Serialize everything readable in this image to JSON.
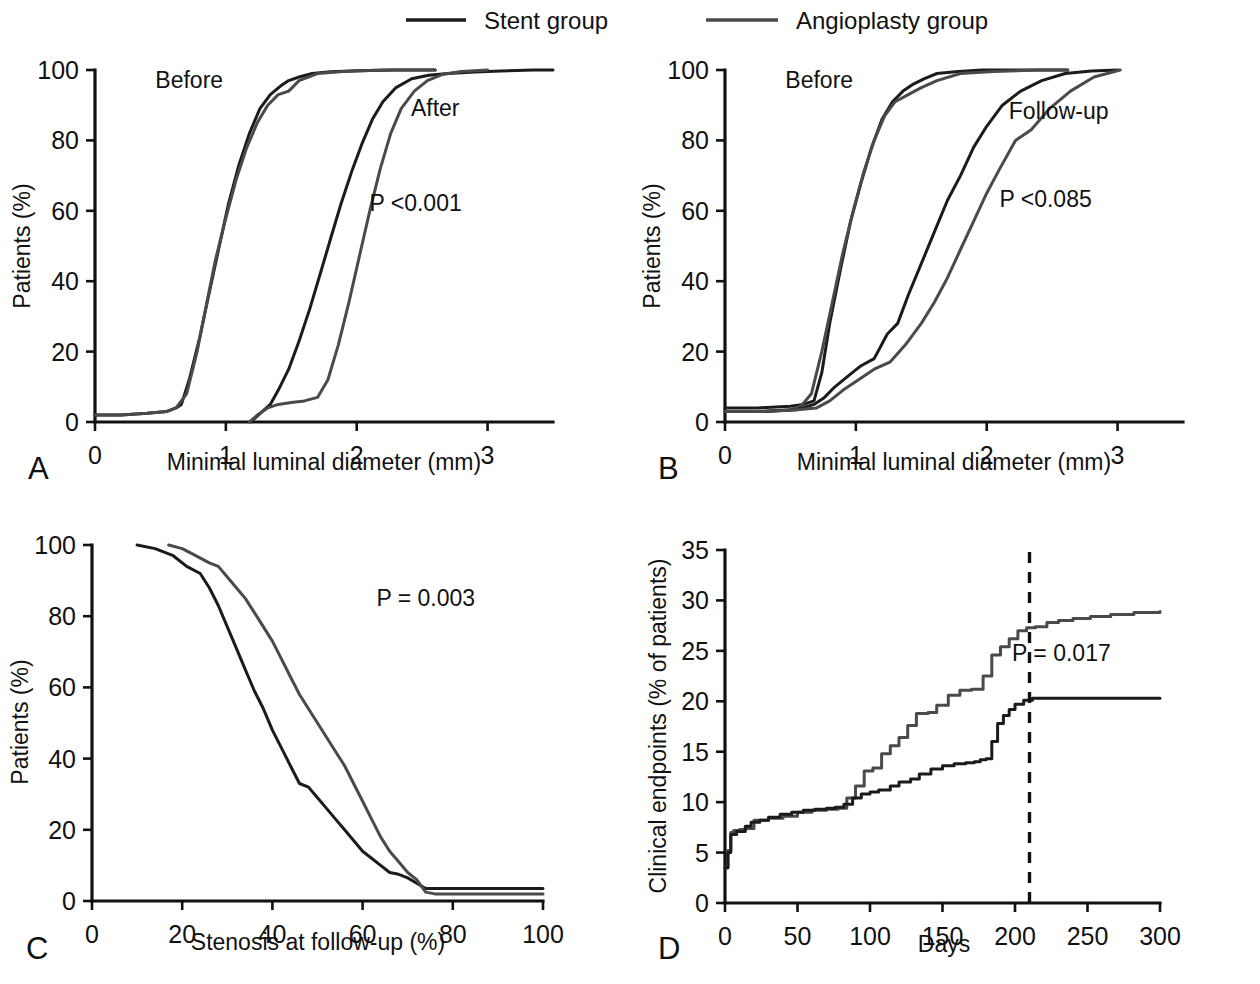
{
  "legend": {
    "items": [
      {
        "label": "Stent group",
        "color": "#1b1b1b",
        "key": "stent"
      },
      {
        "label": "Angioplasty group",
        "color": "#4a4a4a",
        "key": "angioplasty"
      }
    ]
  },
  "panels": {
    "A": {
      "letter": "A",
      "xlabel": "Minimal luminal diameter (mm)",
      "ylabel": "Patients (%)",
      "pvalue": "P <0.001",
      "group_labels": {
        "left": "Before",
        "right": "After"
      }
    },
    "B": {
      "letter": "B",
      "xlabel": "Minimal luminal diameter (mm)",
      "ylabel": "Patients (%)",
      "pvalue": "P <0.085",
      "group_labels": {
        "left": "Before",
        "right": "Follow-up"
      }
    },
    "C": {
      "letter": "C",
      "xlabel": "Stenosis at follow-up (%)",
      "ylabel": "Patients (%)",
      "pvalue": "P = 0.003"
    },
    "D": {
      "letter": "D",
      "xlabel": "Days",
      "ylabel": "Clinical endpoints (% of patients)",
      "pvalue": "P = 0.017",
      "marker_day": 210
    }
  },
  "chart_data": [
    {
      "id": "A",
      "type": "line",
      "title": "",
      "xlabel": "Minimal luminal diameter (mm)",
      "ylabel": "Patients (%)",
      "xlim": [
        0,
        3.5
      ],
      "ylim": [
        0,
        100
      ],
      "xticks": [
        0,
        1,
        2,
        3
      ],
      "yticks": [
        0,
        20,
        40,
        60,
        80,
        100
      ],
      "grid": false,
      "annotations": [
        {
          "text": "Before",
          "x": 0.72,
          "y": 95
        },
        {
          "text": "After",
          "x": 2.6,
          "y": 87
        },
        {
          "text": "P <0.001",
          "x": 2.45,
          "y": 60
        }
      ],
      "series": [
        {
          "name": "Stent group before",
          "color": "#1b1b1b",
          "x": [
            0.0,
            0.2,
            0.4,
            0.55,
            0.62,
            0.66,
            0.72,
            0.8,
            0.88,
            0.95,
            1.02,
            1.1,
            1.18,
            1.26,
            1.34,
            1.42,
            1.48,
            1.56,
            1.66,
            1.8,
            2.0,
            2.3,
            2.6
          ],
          "y": [
            2,
            2,
            2.5,
            3,
            4,
            5,
            12,
            24,
            38,
            50,
            62,
            73,
            82,
            89,
            93,
            95.5,
            97,
            98,
            99,
            99.5,
            99.8,
            100,
            100
          ]
        },
        {
          "name": "Angioplasty group before",
          "color": "#4a4a4a",
          "x": [
            0.0,
            0.2,
            0.4,
            0.55,
            0.62,
            0.7,
            0.78,
            0.85,
            0.92,
            1.0,
            1.08,
            1.16,
            1.24,
            1.32,
            1.4,
            1.48,
            1.56,
            1.7,
            1.9,
            2.2,
            2.6
          ],
          "y": [
            2,
            2,
            2.5,
            3,
            4,
            8,
            20,
            33,
            46,
            58,
            69,
            78,
            85,
            90,
            93,
            94,
            97,
            99,
            99.6,
            100,
            100
          ]
        },
        {
          "name": "Stent group after",
          "color": "#1b1b1b",
          "x": [
            1.18,
            1.22,
            1.28,
            1.34,
            1.4,
            1.48,
            1.56,
            1.64,
            1.72,
            1.8,
            1.88,
            1.96,
            2.04,
            2.12,
            2.2,
            2.3,
            2.42,
            2.55,
            2.7,
            2.9,
            3.1,
            3.35,
            3.5
          ],
          "y": [
            0,
            1,
            3,
            5,
            9,
            15,
            23,
            32,
            42,
            52,
            62,
            71,
            79,
            86,
            91,
            95,
            97.5,
            98.5,
            99,
            99.4,
            99.7,
            100,
            100
          ]
        },
        {
          "name": "Angioplasty group after",
          "color": "#4a4a4a",
          "x": [
            1.18,
            1.24,
            1.32,
            1.4,
            1.5,
            1.6,
            1.7,
            1.78,
            1.86,
            1.94,
            2.02,
            2.1,
            2.18,
            2.26,
            2.34,
            2.44,
            2.54,
            2.66,
            2.8,
            3.0
          ],
          "y": [
            0,
            2,
            4,
            5,
            5.5,
            6,
            7,
            12,
            22,
            34,
            47,
            60,
            72,
            82,
            89,
            94,
            97,
            98.8,
            99.6,
            100
          ]
        }
      ]
    },
    {
      "id": "B",
      "type": "line",
      "title": "",
      "xlabel": "Minimal luminal diameter (mm)",
      "ylabel": "Patients (%)",
      "xlim": [
        0,
        3.5
      ],
      "ylim": [
        0,
        100
      ],
      "xticks": [
        0,
        1,
        2,
        3
      ],
      "yticks": [
        0,
        20,
        40,
        60,
        80,
        100
      ],
      "grid": false,
      "annotations": [
        {
          "text": "Before",
          "x": 0.72,
          "y": 95
        },
        {
          "text": "Follow-up",
          "x": 2.55,
          "y": 86
        },
        {
          "text": "P <0.085",
          "x": 2.45,
          "y": 61
        }
      ],
      "series": [
        {
          "name": "Stent group before",
          "color": "#1b1b1b",
          "x": [
            0.0,
            0.25,
            0.5,
            0.6,
            0.68,
            0.74,
            0.8,
            0.88,
            0.96,
            1.04,
            1.12,
            1.2,
            1.28,
            1.36,
            1.44,
            1.52,
            1.62,
            1.76,
            1.96,
            2.25,
            2.62
          ],
          "y": [
            4,
            4,
            4.5,
            5,
            6,
            14,
            28,
            43,
            57,
            68,
            78,
            86,
            91,
            94,
            96,
            97.5,
            99,
            99.5,
            100,
            100,
            100
          ]
        },
        {
          "name": "Angioplasty group before",
          "color": "#4a4a4a",
          "x": [
            0.0,
            0.25,
            0.5,
            0.58,
            0.66,
            0.74,
            0.82,
            0.9,
            0.98,
            1.06,
            1.14,
            1.22,
            1.3,
            1.4,
            1.5,
            1.62,
            1.8,
            2.05,
            2.4,
            2.62
          ],
          "y": [
            3,
            3,
            3.5,
            4.5,
            8,
            20,
            34,
            48,
            60,
            71,
            80,
            87,
            91,
            93,
            95,
            97,
            99,
            99.6,
            100,
            100
          ]
        },
        {
          "name": "Stent group follow-up",
          "color": "#1b1b1b",
          "x": [
            0.0,
            0.3,
            0.55,
            0.68,
            0.76,
            0.84,
            0.94,
            1.04,
            1.14,
            1.24,
            1.32,
            1.4,
            1.5,
            1.6,
            1.7,
            1.8,
            1.9,
            2.0,
            2.12,
            2.26,
            2.42,
            2.6,
            2.8,
            3.0
          ],
          "y": [
            3,
            3,
            3.5,
            5,
            7,
            10,
            13,
            16,
            18,
            25,
            28,
            36,
            45,
            54,
            63,
            70,
            78,
            84,
            90,
            94,
            97,
            99,
            99.7,
            100
          ]
        },
        {
          "name": "Angioplasty group follow-up",
          "color": "#4a4a4a",
          "x": [
            0.0,
            0.3,
            0.55,
            0.7,
            0.8,
            0.9,
            1.02,
            1.14,
            1.26,
            1.38,
            1.5,
            1.6,
            1.7,
            1.8,
            1.9,
            2.0,
            2.1,
            2.22,
            2.34,
            2.48,
            2.64,
            2.82,
            3.02
          ],
          "y": [
            3,
            3,
            3.5,
            4,
            6,
            9,
            12,
            15,
            17,
            22,
            28,
            34,
            41,
            49,
            57,
            65,
            72,
            80,
            83,
            89,
            94,
            98,
            100
          ]
        }
      ]
    },
    {
      "id": "C",
      "type": "line",
      "title": "",
      "xlabel": "Stenosis at follow-up (%)",
      "ylabel": "Patients (%)",
      "xlim": [
        0,
        100
      ],
      "ylim": [
        0,
        100
      ],
      "xticks": [
        0,
        20,
        40,
        60,
        80,
        100
      ],
      "yticks": [
        0,
        20,
        40,
        60,
        80,
        100
      ],
      "grid": false,
      "annotations": [
        {
          "text": "P = 0.003",
          "x": 74,
          "y": 83
        }
      ],
      "series": [
        {
          "name": "Stent group",
          "color": "#1b1b1b",
          "x": [
            10,
            14,
            18,
            21,
            24,
            26,
            28,
            30,
            32,
            34,
            36,
            38,
            40,
            42,
            44,
            46,
            48,
            50,
            52,
            54,
            56,
            58,
            60,
            62,
            64,
            66,
            68,
            70,
            72,
            74,
            76,
            80,
            90,
            100
          ],
          "y": [
            100,
            99,
            97,
            94,
            92,
            88,
            83,
            77,
            71,
            65,
            59,
            54,
            48,
            43,
            38,
            33,
            32,
            29,
            26,
            23,
            20,
            17,
            14,
            12,
            10,
            8,
            7.5,
            6.5,
            5,
            3.5,
            3.5,
            3.5,
            3.5,
            3.5
          ]
        },
        {
          "name": "Angioplasty group",
          "color": "#4a4a4a",
          "x": [
            17,
            20,
            23,
            26,
            28,
            30,
            32,
            34,
            36,
            38,
            40,
            42,
            44,
            46,
            48,
            50,
            52,
            54,
            56,
            58,
            60,
            62,
            64,
            66,
            68,
            70,
            72,
            74,
            76,
            80,
            90,
            100
          ],
          "y": [
            100,
            99,
            97,
            95,
            94,
            91,
            88,
            85,
            81,
            77,
            73,
            68,
            63,
            58,
            54,
            50,
            46,
            42,
            38,
            33,
            28,
            23,
            18,
            14,
            11,
            8,
            6,
            2.5,
            2,
            2,
            2,
            2
          ]
        }
      ]
    },
    {
      "id": "D",
      "type": "line",
      "title": "",
      "xlabel": "Days",
      "ylabel": "Clinical endpoints (% of patients)",
      "xlim": [
        0,
        300
      ],
      "ylim": [
        0,
        35
      ],
      "xticks": [
        0,
        50,
        100,
        150,
        200,
        250,
        300
      ],
      "yticks": [
        0,
        5,
        10,
        15,
        20,
        25,
        30,
        35
      ],
      "grid": false,
      "vline_x": 210,
      "annotations": [
        {
          "text": "P = 0.017",
          "x": 232,
          "y": 24
        }
      ],
      "series": [
        {
          "name": "Angioplasty group",
          "color": "#4a4a4a",
          "step": true,
          "x": [
            0,
            2,
            4,
            6,
            10,
            14,
            20,
            30,
            40,
            50,
            60,
            70,
            78,
            84,
            90,
            96,
            102,
            108,
            114,
            120,
            126,
            132,
            140,
            146,
            154,
            162,
            170,
            178,
            184,
            190,
            196,
            202,
            208,
            214,
            222,
            230,
            240,
            252,
            266,
            282,
            300
          ],
          "y": [
            3.5,
            5.2,
            7.0,
            7.2,
            7.3,
            7.4,
            8.2,
            8.4,
            8.6,
            9.0,
            9.2,
            9.3,
            9.4,
            10.4,
            11.6,
            13.1,
            13.4,
            14.8,
            15.6,
            16.4,
            17.6,
            18.8,
            18.9,
            19.6,
            20.6,
            21.1,
            21.2,
            22.5,
            24.6,
            25.4,
            26.2,
            27.0,
            27.3,
            27.4,
            27.8,
            28.0,
            28.2,
            28.4,
            28.6,
            28.8,
            28.9
          ]
        },
        {
          "name": "Stent group",
          "color": "#1b1b1b",
          "step": true,
          "x": [
            0,
            2,
            4,
            8,
            14,
            18,
            24,
            30,
            38,
            46,
            54,
            62,
            70,
            76,
            82,
            88,
            94,
            100,
            106,
            114,
            120,
            128,
            134,
            142,
            150,
            158,
            166,
            172,
            176,
            180,
            184,
            188,
            192,
            196,
            200,
            206,
            212,
            230,
            260,
            300
          ],
          "y": [
            3.5,
            5.0,
            6.8,
            7.1,
            7.6,
            8.0,
            8.2,
            8.5,
            8.8,
            9.0,
            9.2,
            9.3,
            9.4,
            9.5,
            9.8,
            10.4,
            10.8,
            11.0,
            11.2,
            11.6,
            12.0,
            12.3,
            12.8,
            13.3,
            13.6,
            13.8,
            13.9,
            14.0,
            14.2,
            14.3,
            16.0,
            17.8,
            18.6,
            19.2,
            19.7,
            20.1,
            20.3,
            20.3,
            20.3,
            20.3
          ]
        }
      ]
    }
  ]
}
